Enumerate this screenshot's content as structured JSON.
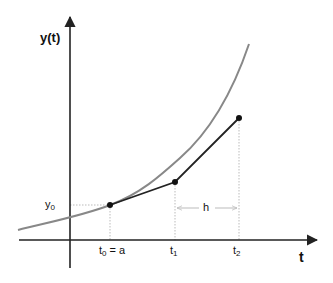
{
  "diagram": {
    "axes": {
      "y_label": "y(t)",
      "x_label": "t"
    },
    "labels": {
      "y0_base": "y",
      "y0_sub": "0",
      "t0_base": "t",
      "t0_sub": "0",
      "t0_suffix": " = a",
      "t1_base": "t",
      "t1_sub": "1",
      "t2_base": "t",
      "t2_sub": "2",
      "step": "h"
    },
    "points": [
      {
        "name": "t0",
        "x": 110,
        "y": 205
      },
      {
        "name": "t1",
        "x": 175,
        "y": 182
      },
      {
        "name": "t2",
        "x": 239,
        "y": 118
      }
    ],
    "colors": {
      "curve": "#888888",
      "euler_path": "#222222",
      "axes": "#222222",
      "guides": "#bbbbbb",
      "points": "#111111"
    }
  }
}
